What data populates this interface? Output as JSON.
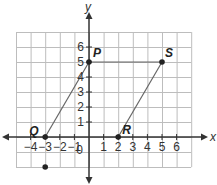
{
  "axes": {
    "x_label": "x",
    "y_label": "y",
    "origin_label": "0",
    "x_ticks": [
      "−4",
      "−3",
      "−2",
      "−1",
      "1",
      "2",
      "3",
      "4",
      "5",
      "6"
    ],
    "x_tick_values": [
      -4,
      -3,
      -2,
      -1,
      1,
      2,
      3,
      4,
      5,
      6
    ],
    "y_ticks": [
      "1",
      "2",
      "3",
      "4",
      "5",
      "6"
    ],
    "y_tick_values": [
      1,
      2,
      3,
      4,
      5,
      6
    ],
    "grid_x_range": [
      -5,
      7
    ],
    "grid_y_range": [
      -2,
      7
    ]
  },
  "points": [
    {
      "name": "P",
      "x": 0,
      "y": 5
    },
    {
      "name": "S",
      "x": 5,
      "y": 5
    },
    {
      "name": "Q",
      "x": -3,
      "y": 0
    },
    {
      "name": "R",
      "x": 2,
      "y": 0
    }
  ],
  "extra_point": {
    "x": -3,
    "y": -2
  },
  "segments": [
    [
      "Q",
      "P"
    ],
    [
      "P",
      "S"
    ],
    [
      "R",
      "S"
    ]
  ],
  "colors": {
    "grid": "#bdbdbd",
    "axis": "#333333",
    "shape": "#666666",
    "point": "#222222"
  }
}
